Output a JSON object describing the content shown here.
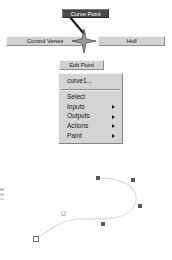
{
  "annotations": {
    "curve_point_label": "Curve Point",
    "control_vertex_label": "Control Vertex",
    "hull_label": "Hull",
    "edit_point_label": "Edit Point"
  },
  "context_menu": {
    "title": "curve1...",
    "items": [
      {
        "label": "Select",
        "has_submenu": false
      },
      {
        "label": "Inputs",
        "has_submenu": true
      },
      {
        "label": "Outputs",
        "has_submenu": true
      },
      {
        "label": "Actions",
        "has_submenu": true
      },
      {
        "label": "Paint",
        "has_submenu": true
      }
    ]
  },
  "viewport": {
    "u_label": "U",
    "curve_color": "#d9d9d9",
    "cv_color": "#5a5a5a",
    "edit_point_color": "#6e6e6e",
    "control_vertices": [
      {
        "x": 98,
        "y": 178
      },
      {
        "x": 133,
        "y": 180
      },
      {
        "x": 140,
        "y": 206
      },
      {
        "x": 103,
        "y": 224
      }
    ],
    "edit_points": [
      {
        "x": 36,
        "y": 239
      }
    ],
    "curve_path": "M 38 238 C 52 228 62 220 78 219 C 96 218 120 222 131 210 C 141 199 136 186 120 181 C 110 178 102 178 98 179"
  },
  "icons": {
    "star_manipulator": "four-point-star",
    "submenu_arrow": "triangle-right"
  },
  "colors": {
    "button_face": "#d2d2d2",
    "button_dark": "#4a4a4a",
    "menu_face": "#d4d4d4",
    "text": "#141414"
  }
}
